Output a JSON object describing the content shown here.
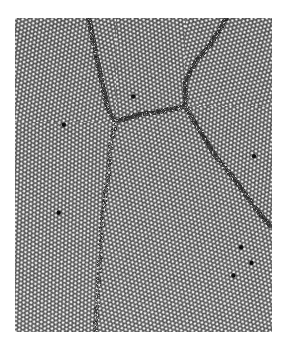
{
  "image": {
    "description": "Grayscale micrograph of a close-packed hexagonal particle lattice showing several crystalline grains separated by dark grain boundaries, with scattered point defects",
    "background_color": "#ffffff",
    "lattice_light": "#e6e6e6",
    "lattice_dark": "#2a2a2a",
    "boundary_color": "#111111"
  },
  "grains": [
    {
      "name": "grain-top-left",
      "orientation_deg": 8
    },
    {
      "name": "grain-top-center",
      "orientation_deg": -6
    },
    {
      "name": "grain-top-right",
      "orientation_deg": 14
    },
    {
      "name": "grain-lower-left",
      "orientation_deg": 2
    },
    {
      "name": "grain-lower-center",
      "orientation_deg": -10
    },
    {
      "name": "grain-lower-right",
      "orientation_deg": 5
    }
  ],
  "boundaries": [
    {
      "name": "boundary-left-upper",
      "points": [
        [
          0.285,
          0.0
        ],
        [
          0.3,
          0.06
        ],
        [
          0.33,
          0.18
        ],
        [
          0.36,
          0.29
        ],
        [
          0.39,
          0.33
        ]
      ]
    },
    {
      "name": "boundary-horizontal",
      "points": [
        [
          0.39,
          0.33
        ],
        [
          0.46,
          0.31
        ],
        [
          0.53,
          0.3
        ],
        [
          0.6,
          0.29
        ],
        [
          0.66,
          0.28
        ]
      ]
    },
    {
      "name": "boundary-right-upper",
      "points": [
        [
          0.82,
          0.0
        ],
        [
          0.76,
          0.08
        ],
        [
          0.7,
          0.14
        ],
        [
          0.66,
          0.2
        ],
        [
          0.66,
          0.28
        ]
      ]
    },
    {
      "name": "boundary-right-lower",
      "points": [
        [
          0.66,
          0.28
        ],
        [
          0.72,
          0.36
        ],
        [
          0.78,
          0.44
        ],
        [
          0.86,
          0.52
        ],
        [
          0.93,
          0.6
        ],
        [
          0.99,
          0.66
        ]
      ]
    },
    {
      "name": "boundary-left-lower",
      "points": [
        [
          0.39,
          0.33
        ],
        [
          0.37,
          0.4
        ],
        [
          0.36,
          0.5
        ],
        [
          0.34,
          0.62
        ],
        [
          0.33,
          0.75
        ],
        [
          0.32,
          0.88
        ],
        [
          0.31,
          1.0
        ]
      ],
      "faint": true
    }
  ],
  "defects": [
    {
      "name": "defect",
      "pos": [
        0.46,
        0.25
      ]
    },
    {
      "name": "defect",
      "pos": [
        0.92,
        0.78
      ]
    },
    {
      "name": "defect",
      "pos": [
        0.85,
        0.82
      ]
    },
    {
      "name": "defect",
      "pos": [
        0.17,
        0.62
      ]
    },
    {
      "name": "defect",
      "pos": [
        0.93,
        0.44
      ]
    },
    {
      "name": "defect",
      "pos": [
        0.19,
        0.34
      ]
    },
    {
      "name": "defect",
      "pos": [
        0.88,
        0.73
      ]
    }
  ]
}
